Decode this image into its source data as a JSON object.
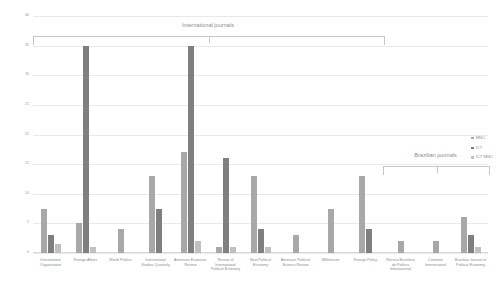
{
  "chart_data": {
    "type": "bar",
    "title": "",
    "xlabel": "",
    "ylabel": "",
    "ylim": [
      0,
      40
    ],
    "ytick_step": 5,
    "grid": true,
    "legend_position": "right",
    "yticks": [
      "0",
      "5",
      "10",
      "15",
      "20",
      "25",
      "30",
      "35",
      "40"
    ],
    "categories": [
      "International Organization",
      "Foreign Affairs",
      "World Politics",
      "International Studies Quarterly",
      "American Economic Review",
      "Review of International Political Economy",
      "New Political Economy",
      "American Political Science Review",
      "Millennium",
      "Foreign Policy",
      "Revista Brasileira de Política Internacional",
      "Contexto Internacional",
      "Brazilian Journal of Political Economy"
    ],
    "series": [
      {
        "name": "MNC",
        "color": "#a8a8a8",
        "values": [
          7.5,
          5,
          4,
          13,
          17,
          1,
          13,
          3,
          7.5,
          13,
          2,
          2,
          6
        ]
      },
      {
        "name": "ICT",
        "color": "#7f7f7f",
        "values": [
          3,
          35,
          0,
          7.5,
          35,
          16,
          4,
          0,
          0,
          4,
          0,
          0,
          3
        ]
      },
      {
        "name": "ICT MNC",
        "color": "#c0c0c0",
        "values": [
          1.5,
          1,
          0,
          0,
          2,
          1,
          1,
          0,
          0,
          0,
          0,
          0,
          1
        ]
      }
    ],
    "annotations": [
      {
        "label": "International journals",
        "span": [
          0,
          9
        ]
      },
      {
        "label": "Brazilian journals",
        "span": [
          10,
          12
        ]
      }
    ]
  },
  "legend": {
    "items": [
      {
        "label": "MNC"
      },
      {
        "label": "ICT"
      },
      {
        "label": "ICT MNC"
      }
    ]
  },
  "brackets": {
    "international": "International journals",
    "brazilian": "Brazilian journals"
  }
}
